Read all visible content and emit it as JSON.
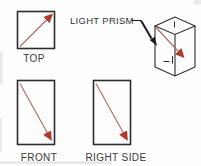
{
  "figure": {
    "callout": {
      "label": "LIGHT PRISM"
    },
    "views": [
      {
        "id": "top",
        "label": "TOP"
      },
      {
        "id": "front",
        "label": "FRONT"
      },
      {
        "id": "right-side",
        "label": "RIGHT SIDE"
      }
    ],
    "colors": {
      "ink": "#2d2d2d",
      "arrow_shaft": "#ad6a5e",
      "arrow_head": "#b0392a",
      "leader": "#1c1c1c",
      "text": "#3a3a3a",
      "background": "#fdfdfd"
    }
  }
}
